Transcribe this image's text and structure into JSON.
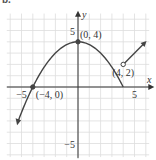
{
  "problem_label": "b.",
  "chart_data": {
    "type": "line",
    "title": "",
    "xlabel": "x",
    "ylabel": "y",
    "xlim": [
      -6,
      6
    ],
    "ylim": [
      -6,
      6
    ],
    "grid": true,
    "x_ticks": [
      {
        "value": -5,
        "label": "-5"
      },
      {
        "value": 5,
        "label": "5"
      }
    ],
    "y_ticks": [
      {
        "value": 5,
        "label": "5"
      },
      {
        "value": -5,
        "label": "-5"
      }
    ],
    "series": [
      {
        "name": "f(x) curve",
        "description": "Parabola-like curve increasing from lower-left through (-4,0) to max at (0,4), decreasing to (4,2); then straight line rising to upper right",
        "x": [
          -5.3,
          -4,
          -3,
          -2,
          -1,
          0,
          1,
          2,
          3,
          4
        ],
        "y": [
          -4.5,
          0,
          1.75,
          3,
          3.75,
          4,
          3.875,
          3.5,
          2.875,
          2
        ]
      },
      {
        "name": "linear piece",
        "x": [
          4,
          5.8
        ],
        "y": [
          2,
          3.8
        ]
      }
    ],
    "points": [
      {
        "x": -4,
        "y": 0,
        "label": "(-4, 0)",
        "style": "filled"
      },
      {
        "x": 0,
        "y": 4,
        "label": "(0, 4)",
        "style": "filled"
      },
      {
        "x": 4,
        "y": 2,
        "label": "(4, 2)",
        "style": "open"
      }
    ],
    "colors": {
      "curve": "#444444",
      "grid": "#dddddd",
      "axis": "#333333"
    }
  }
}
